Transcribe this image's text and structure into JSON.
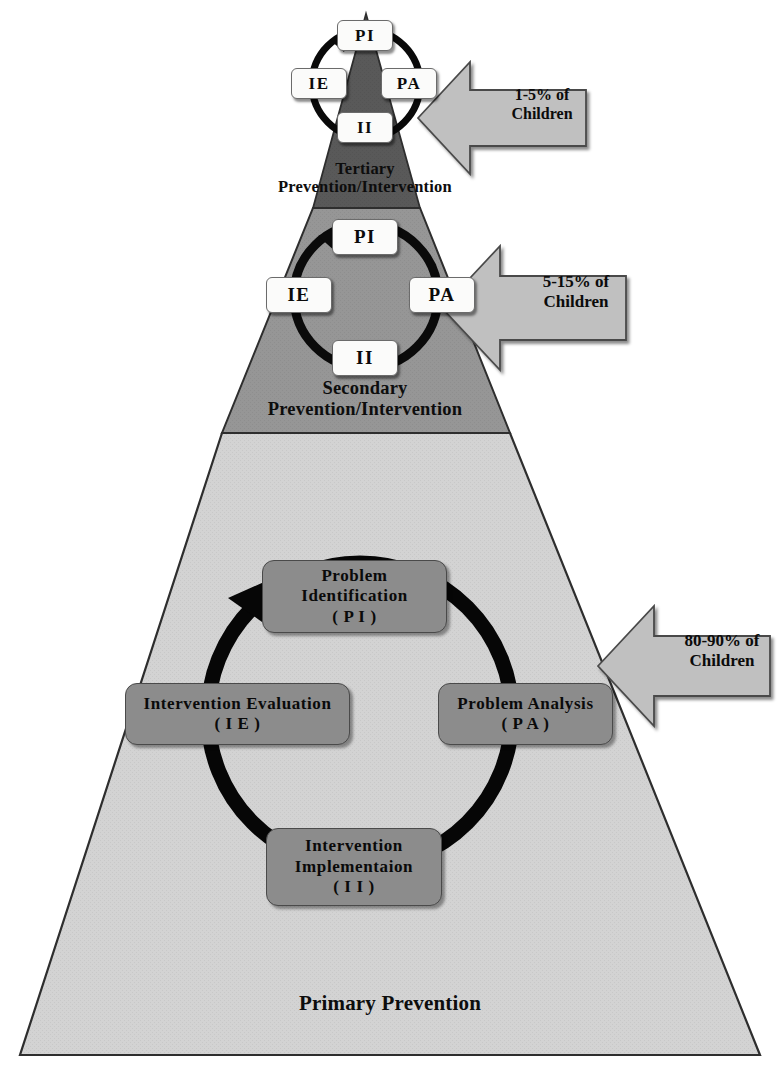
{
  "diagram": {
    "colors": {
      "tertiary_fill": "#595959",
      "secondary_fill": "#969696",
      "primary_fill": "#d3d3d3",
      "node_fill": "#8c8c8c",
      "chip_fill": "#fbfbfa",
      "arrow_fill": "#c0c0c0",
      "cycle_ring": "#000000",
      "outline": "#3a3a3a"
    }
  },
  "tiers": [
    {
      "id": "tertiary",
      "label": "Tertiary\nPrevention/Intervention",
      "callout": "1-5% of\nChildren"
    },
    {
      "id": "secondary",
      "label": "Secondary\nPrevention/Intervention",
      "callout": "5-15% of\nChildren"
    },
    {
      "id": "primary",
      "label": "Primary Prevention",
      "callout": "80-90% of\nChildren"
    }
  ],
  "tertiary_cycle": {
    "pi": "PI",
    "pa": "PA",
    "ii": "II",
    "ie": "IE"
  },
  "secondary_cycle": {
    "pi": "PI",
    "pa": "PA",
    "ii": "II",
    "ie": "IE"
  },
  "primary_cycle": {
    "pi": "Problem\nIdentification\n( P I )",
    "pa": "Problem Analysis\n( P A )",
    "ii": "Intervention\nImplementaion\n( I I )",
    "ie": "Intervention Evaluation\n( I E )"
  },
  "icons": {
    "cycle_arrow": "cycle-arrow-icon",
    "callout_arrow": "left-pointing-arrow-icon"
  }
}
